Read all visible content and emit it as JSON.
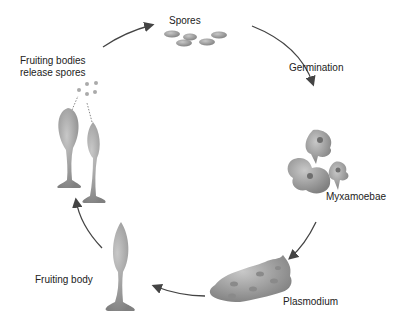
{
  "diagram": {
    "type": "life-cycle",
    "stages": [
      {
        "id": "spores",
        "label": "Spores"
      },
      {
        "id": "germination",
        "label": "Germination"
      },
      {
        "id": "myxamoebae",
        "label": "Myxamoebae"
      },
      {
        "id": "plasmodium",
        "label": "Plasmodium"
      },
      {
        "id": "fruiting-body",
        "label": "Fruiting body"
      },
      {
        "id": "fruiting-bodies-release",
        "label_line1": "Fruiting bodies",
        "label_line2": "release spores"
      }
    ],
    "colors": {
      "arrow": "#444444",
      "organism": "#9a9a9a",
      "organism_dark": "#7a7a7a",
      "text": "#222222"
    }
  }
}
